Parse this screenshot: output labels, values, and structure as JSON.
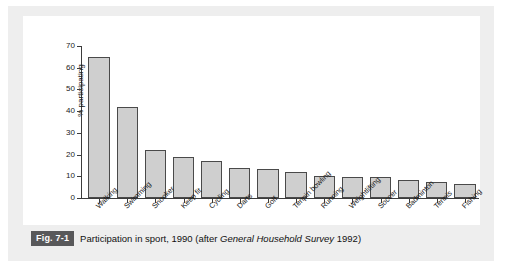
{
  "figure": {
    "badge": "Fig. 7-1",
    "caption_before": "Participation in sport, 1990 (after ",
    "caption_source_italic": "General Household Survey",
    "caption_after": " 1992)"
  },
  "colors": {
    "bar_fill": "#cfcfcf",
    "bar_stroke": "#4a4a4a",
    "axis": "#3c3c3c",
    "badge_bg": "#58585a",
    "mat_bg": "#eeeeee",
    "panel_bg": "#ffffff"
  },
  "chart_data": {
    "type": "bar",
    "title": "Participation in sport, 1990",
    "xlabel": "",
    "ylabel": "% participating",
    "ylim": [
      0,
      70
    ],
    "ytick_step": 10,
    "yticks": [
      0,
      10,
      20,
      30,
      40,
      50,
      60,
      70
    ],
    "grid": false,
    "legend": false,
    "categories": [
      "Walking",
      "Swimming",
      "Snooker",
      "Keep fit",
      "Cycling",
      "Darts",
      "Golf",
      "Tenpin bowling",
      "Running",
      "Weightlifting",
      "Soccer",
      "Badminton",
      "Tennis",
      "Fishing"
    ],
    "values": [
      65.0,
      41.7,
      21.9,
      19.0,
      17.0,
      14.0,
      13.3,
      12.0,
      10.0,
      9.6,
      9.6,
      8.5,
      7.4,
      6.3
    ]
  }
}
